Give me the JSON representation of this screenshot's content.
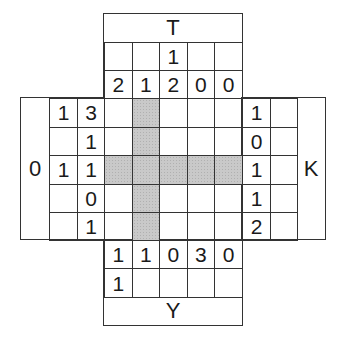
{
  "puzzle": {
    "labels": {
      "top": "T",
      "bottom": "Y",
      "left": "0",
      "right": "K"
    },
    "top_clues": {
      "row1": [
        "",
        "",
        "1",
        "",
        ""
      ],
      "row2": [
        "2",
        "1",
        "2",
        "0",
        "0"
      ]
    },
    "bottom_clues": {
      "row1": [
        "1",
        "1",
        "0",
        "3",
        "0"
      ],
      "row2": [
        "1",
        "",
        "",
        "",
        ""
      ]
    },
    "left_clues": {
      "col1": [
        "1",
        "",
        "1",
        "",
        ""
      ],
      "col2": [
        "3",
        "1",
        "1",
        "0",
        "1"
      ]
    },
    "right_clues": {
      "col1": [
        "1",
        "0",
        "1",
        "1",
        "2"
      ],
      "col2": [
        "",
        "",
        "",
        "",
        ""
      ]
    },
    "grid": {
      "rows": 5,
      "cols": 5,
      "shaded": [
        [
          0,
          1
        ],
        [
          1,
          1
        ],
        [
          2,
          0
        ],
        [
          2,
          1
        ],
        [
          2,
          2
        ],
        [
          2,
          3
        ],
        [
          2,
          4
        ],
        [
          3,
          1
        ],
        [
          4,
          1
        ]
      ]
    },
    "colors": {
      "shade": "#c9c9c9",
      "line": "#333333",
      "text": "#1a1a1a"
    }
  }
}
